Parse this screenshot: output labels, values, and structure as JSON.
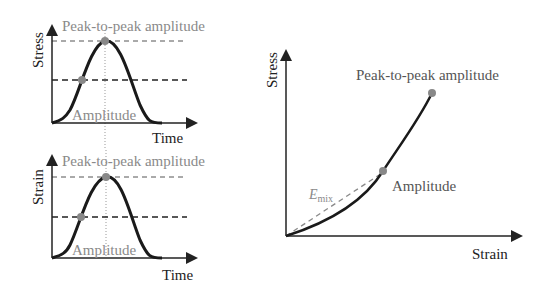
{
  "panels": {
    "stress_time": {
      "ylabel": "Stress",
      "xlabel": "Time",
      "peak_label": "Peak-to-peak amplitude",
      "amp_label": "Amplitude"
    },
    "strain_time": {
      "ylabel": "Strain",
      "xlabel": "Time",
      "peak_label": "Peak-to-peak amplitude",
      "amp_label": "Amplitude"
    },
    "stress_strain": {
      "ylabel": "Stress",
      "xlabel": "Strain",
      "peak_label": "Peak-to-peak amplitude",
      "amp_label": "Amplitude",
      "modulus_label": "E",
      "modulus_sub": "mix"
    }
  },
  "colors": {
    "curve": "#1a1a1a",
    "marker": "#888888",
    "label_gray": "#8a8a8a",
    "axis": "#222222"
  }
}
